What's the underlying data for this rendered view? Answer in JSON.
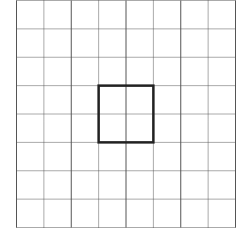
{
  "diagram": {
    "type": "square-grid",
    "rows": 8,
    "cols": 8,
    "grid_left": 16.5,
    "grid_top": 0.5,
    "grid_right": 235.5,
    "grid_bottom": 227.5,
    "line_color": "#555555",
    "line_style": "dotted",
    "highlight": {
      "label": "bold square",
      "col_start": 3,
      "row_start": 3,
      "col_span": 2,
      "row_span": 2,
      "color": "#222222",
      "stroke_width": 2.5
    }
  }
}
